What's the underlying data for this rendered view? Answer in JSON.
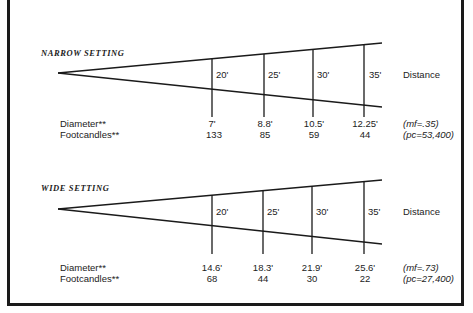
{
  "sections": [
    {
      "title": "NARROW SETTING",
      "distance_label": "Distance",
      "distances": [
        "20'",
        "25'",
        "30'",
        "35'"
      ],
      "row_labels": [
        "Diameter**",
        "Footcandles**"
      ],
      "diameters": [
        "7'",
        "8.8'",
        "10.5'",
        "12.25'"
      ],
      "footcandles": [
        "133",
        "85",
        "59",
        "44"
      ],
      "mf": "(mf=.35)",
      "pc": "(pc=53,400)"
    },
    {
      "title": "WIDE SETTING",
      "distance_label": "Distance",
      "distances": [
        "20'",
        "25'",
        "30'",
        "35'"
      ],
      "row_labels": [
        "Diameter**",
        "Footcandles**"
      ],
      "diameters": [
        "14.6'",
        "18.3'",
        "21.9'",
        "25.6'"
      ],
      "footcandles": [
        "68",
        "44",
        "30",
        "22"
      ],
      "mf": "(mf=.73)",
      "pc": "(pc=27,400)"
    }
  ],
  "colors": {
    "line": "#1a1a1a",
    "text": "#222222",
    "background": "#ffffff"
  }
}
